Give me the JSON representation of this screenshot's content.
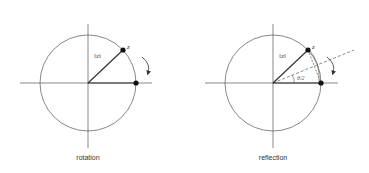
{
  "diagrams": [
    {
      "caption": "rotation",
      "norm_label": "‖z‖",
      "point_label": "z"
    },
    {
      "caption": "reflection",
      "norm_label": "‖z‖",
      "point_label": "z",
      "angle_label": "θ/2"
    }
  ],
  "colors": {
    "stroke": "#444444",
    "point": "#111111",
    "text": "#333333"
  }
}
